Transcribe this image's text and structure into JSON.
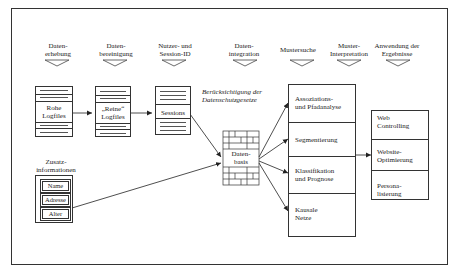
{
  "stages": [
    {
      "label_line1": "Daten-",
      "label_line2": "erhebung"
    },
    {
      "label_line1": "Daten-",
      "label_line2": "bereinigung"
    },
    {
      "label_line1": "Nutzer- und",
      "label_line2": "Session-ID"
    },
    {
      "label_line1": "Daten-",
      "label_line2": "integration"
    },
    {
      "label_line1": "Mustersuche",
      "label_line2": ""
    },
    {
      "label_line1": "Muster-",
      "label_line2": "Interpretation"
    },
    {
      "label_line1": "Anwendung der",
      "label_line2": "Ergebnisse"
    }
  ],
  "docs": {
    "raw_logfiles": {
      "line1": "Rohe",
      "line2": "Logfiles"
    },
    "clean_logfiles": {
      "line1": "„Reine“",
      "line2": "Logfiles"
    },
    "sessions": {
      "line1": "Sessions"
    }
  },
  "privacy_note": {
    "line1": "Berücksichtigung der",
    "line2": "Datenschutzgesetze"
  },
  "extra_info": {
    "title_line1": "Zusatz-",
    "title_line2": "informationen",
    "fields": [
      "Name",
      "Adresse",
      "Alter"
    ]
  },
  "database": {
    "line1": "Daten-",
    "line2": "basis"
  },
  "methods": [
    {
      "line1": "Assoziations-",
      "line2": "und Pfadanalyse"
    },
    {
      "line1": "Segmentierung",
      "line2": ""
    },
    {
      "line1": "Klassifikation",
      "line2": "und Prognose"
    },
    {
      "line1": "Kausale",
      "line2": "Netze"
    }
  ],
  "applications": [
    {
      "line1": "Web",
      "line2": "Controlling"
    },
    {
      "line1": "Website-",
      "line2": "Optimierung"
    },
    {
      "line1": "Persona-",
      "line2": "lisierung"
    }
  ]
}
